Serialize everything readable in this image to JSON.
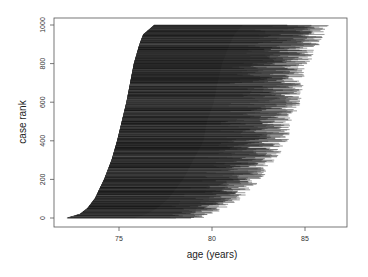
{
  "chart_data": {
    "type": "line",
    "subtype": "horizontal-segments (lexis-style follow-up lines)",
    "title": "",
    "xlabel": "age (years)",
    "ylabel": "case rank",
    "xlim": [
      71.5,
      87.5
    ],
    "ylim": [
      -40,
      1040
    ],
    "x_ticks": [
      75,
      80,
      85
    ],
    "y_ticks": [
      0,
      200,
      400,
      600,
      800,
      1000
    ],
    "grid": false,
    "legend": null,
    "n_cases": 1000,
    "entry_age_by_rank": {
      "rank": [
        0,
        20,
        50,
        100,
        200,
        300,
        400,
        500,
        600,
        700,
        800,
        900,
        950,
        1000
      ],
      "age": [
        72.2,
        72.9,
        73.3,
        73.7,
        74.2,
        74.6,
        74.9,
        75.15,
        75.4,
        75.6,
        75.8,
        76.1,
        76.3,
        76.9
      ]
    },
    "exit_age_envelope_by_rank": {
      "rank": [
        0,
        50,
        100,
        200,
        300,
        400,
        500,
        600,
        700,
        800,
        900,
        1000
      ],
      "max_age": [
        79.5,
        80.8,
        81.6,
        82.7,
        83.4,
        84.2,
        84.3,
        84.8,
        85.0,
        85.3,
        85.8,
        86.4
      ]
    },
    "line_color": "#1a1a1a"
  },
  "axes": {
    "x_tick_labels": [
      "75",
      "80",
      "85"
    ],
    "y_tick_labels": [
      "0",
      "200",
      "400",
      "600",
      "800",
      "1000"
    ],
    "x_title": "age (years)",
    "y_title": "case rank"
  }
}
